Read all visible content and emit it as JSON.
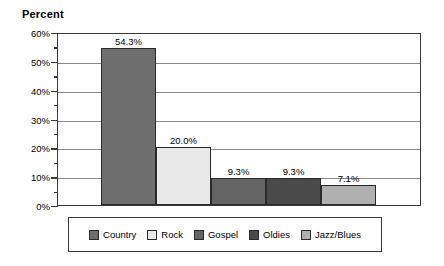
{
  "chart_data": {
    "type": "bar",
    "title": "Percent",
    "xlabel": "",
    "ylabel": "",
    "categories": [
      "Country",
      "Rock",
      "Gospel",
      "Oldies",
      "Jazz/Blues"
    ],
    "values": [
      54.3,
      20.0,
      9.3,
      9.3,
      7.1
    ],
    "value_labels": [
      "54.3%",
      "20.0%",
      "9.3%",
      "9.3%",
      "7.1%"
    ],
    "ylim": [
      0,
      60
    ],
    "y_tick_labels": [
      "60%",
      "50%",
      "40%",
      "30%",
      "20%",
      "10%",
      "0%"
    ],
    "y_tick_values": [
      60,
      50,
      40,
      30,
      20,
      10,
      0
    ],
    "y_minor_tick_values": [
      55,
      45,
      35,
      25,
      15,
      5
    ],
    "grid": true,
    "grid_axis": "y",
    "legend_position": "bottom",
    "legend": [
      {
        "label": "Country",
        "color": "#6e6e6e"
      },
      {
        "label": "Rock",
        "color": "#e9e9e9"
      },
      {
        "label": "Gospel",
        "color": "#646464"
      },
      {
        "label": "Oldies",
        "color": "#4a4a4a"
      },
      {
        "label": "Jazz/Blues",
        "color": "#b0b0b0"
      }
    ],
    "colors": [
      "#6e6e6e",
      "#e9e9e9",
      "#646464",
      "#4a4a4a",
      "#b0b0b0"
    ],
    "axis_color": "#3a3a3a",
    "gridline_color": "#8a8a8a",
    "bar_border_color": "#2a2a2a",
    "background": "#ffffff"
  }
}
